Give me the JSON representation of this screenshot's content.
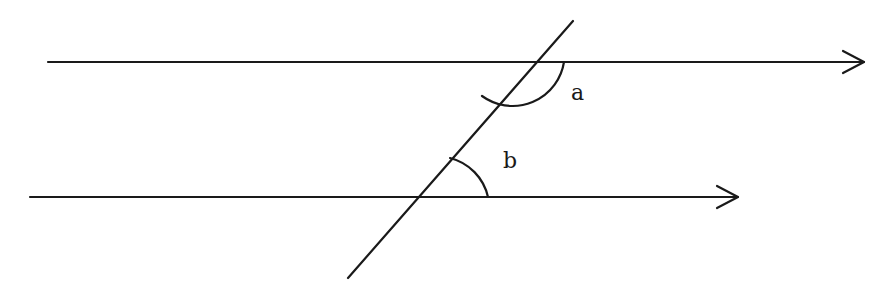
{
  "diagram": {
    "type": "parallel-lines-transversal",
    "stroke_color": "#1a1a1a",
    "background": "#ffffff",
    "lines": {
      "top": {
        "x1": 48,
        "y1": 62,
        "x2": 864,
        "y2": 62,
        "arrow": "right"
      },
      "bottom": {
        "x1": 30,
        "y1": 197,
        "x2": 738,
        "y2": 197,
        "arrow": "right"
      },
      "transversal": {
        "x1": 573,
        "y1": 21,
        "x2": 348,
        "y2": 278
      }
    },
    "angles": {
      "a": {
        "label": "a",
        "vertex": [
          512,
          62
        ],
        "label_pos": [
          571,
          100
        ]
      },
      "b": {
        "label": "b",
        "vertex": [
          416,
          197
        ],
        "label_pos": [
          503,
          168
        ]
      }
    }
  }
}
